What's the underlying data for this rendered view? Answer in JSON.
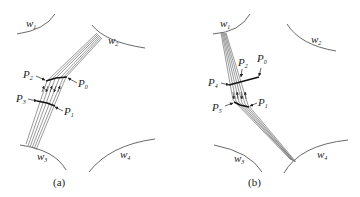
{
  "panels": [
    {
      "id": "a",
      "caption": "(a)",
      "regions": [
        "w1",
        "w2",
        "w3",
        "w4"
      ],
      "points": [
        "P0",
        "P1",
        "P2",
        "P3"
      ],
      "path": "bundle of lines from region w2 bending at P2–P0 segment and continuing to region w3"
    },
    {
      "id": "b",
      "caption": "(b)",
      "regions": [
        "w1",
        "w2",
        "w3",
        "w4"
      ],
      "points": [
        "P0",
        "P1",
        "P2",
        "P4",
        "P5"
      ],
      "path": "bundle of lines from region w1 crossing P4–P0 segment, bending at P5–P1 and continuing to region w4"
    }
  ],
  "labels": {
    "a": {
      "w1": "w",
      "w1_sub": "1",
      "w2": "w",
      "w2_sub": "2",
      "w3": "w",
      "w3_sub": "3",
      "w4": "w",
      "w4_sub": "4",
      "P0": "P",
      "P0_sub": "0",
      "P1": "P",
      "P1_sub": "1",
      "P2": "P",
      "P2_sub": "2",
      "P3": "P",
      "P3_sub": "3",
      "caption": "(a)"
    },
    "b": {
      "w1": "w",
      "w1_sub": "1",
      "w2": "w",
      "w2_sub": "2",
      "w3": "w",
      "w3_sub": "3",
      "w4": "w",
      "w4_sub": "4",
      "P0": "P",
      "P0_sub": "0",
      "P1": "P",
      "P1_sub": "1",
      "P2": "P",
      "P2_sub": "2",
      "P4": "P",
      "P4_sub": "4",
      "P5": "P",
      "P5_sub": "5",
      "caption": "(b)"
    }
  },
  "colors": {
    "stroke": "#333333",
    "text": "#222222",
    "background": "#ffffff"
  }
}
